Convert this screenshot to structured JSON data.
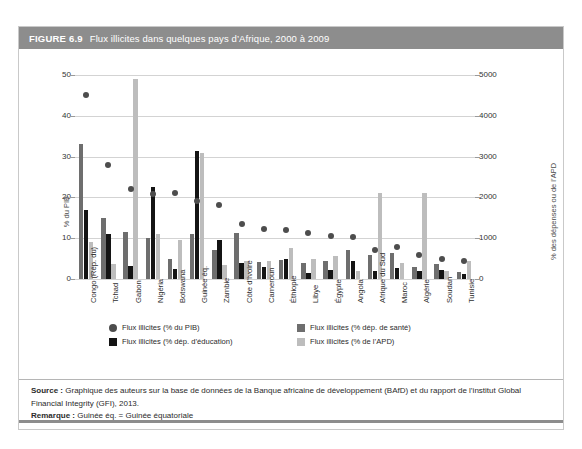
{
  "figure": {
    "number": "FIGURE 6.9",
    "title": "Flux illicites dans quelques pays d’Afrique, 2000 à 2009"
  },
  "footer": {
    "source_label": "Source :",
    "source_text": " Graphique des auteurs sur la base de données de la Banque africaine de développement (BAfD) et du rapport de l’institut Global Financial Integrity (GFI), 2013.",
    "remark_label": "Remarque :",
    "remark_text": " Guinée éq. = Guinée équatoriale"
  },
  "legend": {
    "items": [
      {
        "label": "Flux illicites (% du PIB)",
        "swatch": "dot",
        "color": "#4d4d4d"
      },
      {
        "label": "Flux illicites (% dép. de santé)",
        "swatch": "square",
        "color": "#6e6e6e"
      },
      {
        "label": "Flux illicites (% dép. d’éducation)",
        "swatch": "square",
        "color": "#141414"
      },
      {
        "label": "Flux illicites (% de l’APD)",
        "swatch": "square",
        "color": "#bdbdbd"
      }
    ]
  },
  "chart_data": {
    "type": "bar",
    "title": "Flux illicites dans quelques pays d’Afrique, 2000 à 2009",
    "xlabel": "",
    "ylabel": "% du PIB",
    "y2label": "% des dépenses ou de l’APD",
    "ylim": [
      0,
      50
    ],
    "y2lim": [
      0,
      5000
    ],
    "yticks": [
      0,
      10,
      20,
      30,
      40,
      50
    ],
    "y2ticks": [
      0,
      1000,
      2000,
      3000,
      4000,
      5000
    ],
    "grid": true,
    "legend_position": "bottom",
    "categories": [
      "Congo (Rép. du)",
      "Tchad",
      "Gabon",
      "Nigéria",
      "Botswana",
      "Guinée éq.",
      "Zambie",
      "Côte d’Ivoire",
      "Cameroun",
      "Éthiopie",
      "Libye",
      "Égypte",
      "Angola",
      "Afrique du Sud",
      "Maroc",
      "Algérie",
      "Soudan",
      "Tunisie"
    ],
    "series": [
      {
        "name": "Flux illicites (% du PIB)",
        "type": "scatter",
        "axis": "left",
        "color": "#4d4d4d",
        "values": [
          45.0,
          28.0,
          22.0,
          20.8,
          21.2,
          19.0,
          18.2,
          13.5,
          12.3,
          12.0,
          11.3,
          10.6,
          10.2,
          7.0,
          7.8,
          5.8,
          5.0,
          4.3
        ]
      },
      {
        "name": "Flux illicites (% dép. de santé)",
        "type": "bar",
        "axis": "right",
        "color": "#6e6e6e",
        "values": [
          33.0,
          15.0,
          11.5,
          10.0,
          5.0,
          11.0,
          7.0,
          11.2,
          4.2,
          4.6,
          4.0,
          4.5,
          7.0,
          5.8,
          6.3,
          3.0,
          3.6,
          1.8
        ]
      },
      {
        "name": "Flux illicites (% dép. d’éducation)",
        "type": "bar",
        "axis": "right",
        "color": "#141414",
        "values": [
          17.0,
          11.0,
          3.2,
          22.5,
          2.5,
          31.3,
          9.5,
          4.0,
          3.0,
          5.0,
          1.5,
          2.3,
          4.5,
          2.0,
          2.8,
          2.0,
          2.2,
          1.2
        ]
      },
      {
        "name": "Flux illicites (% de l’APD)",
        "type": "bar",
        "axis": "right",
        "color": "#bdbdbd",
        "values": [
          9.0,
          3.6,
          49.0,
          11.0,
          9.5,
          31.0,
          3.5,
          4.5,
          4.5,
          7.5,
          5.0,
          5.6,
          2.0,
          21.0,
          4.0,
          21.0,
          1.9,
          4.3
        ]
      }
    ]
  }
}
